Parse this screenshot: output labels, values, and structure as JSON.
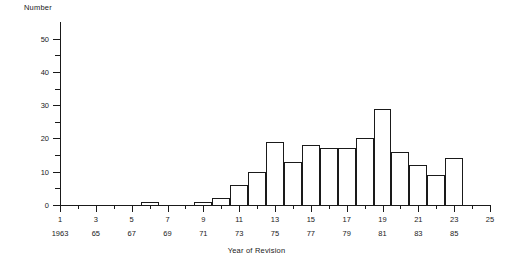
{
  "chart_data": {
    "type": "bar",
    "title": "",
    "xlabel": "Year of Revision",
    "ylabel": "Number",
    "ylim": [
      0,
      55
    ],
    "ytick_values": [
      0,
      10,
      20,
      30,
      40,
      50
    ],
    "ytick_labels": [
      "0",
      "10",
      "20",
      "30",
      "40",
      "50"
    ],
    "yminor_values": [
      5,
      15,
      25,
      35,
      45
    ],
    "grid": false,
    "legend": null,
    "xlim": [
      1,
      25
    ],
    "xtick_index_labels": [
      "1",
      "3",
      "5",
      "7",
      "9",
      "11",
      "13",
      "15",
      "17",
      "19",
      "21",
      "23",
      "25"
    ],
    "xtick_year_labels": [
      "1963",
      "65",
      "67",
      "69",
      "71",
      "73",
      "75",
      "77",
      "79",
      "81",
      "83",
      "85",
      ""
    ],
    "xtick_index_values": [
      1,
      3,
      5,
      7,
      9,
      11,
      13,
      15,
      17,
      19,
      21,
      23,
      25
    ],
    "xminor_values": [
      2,
      4,
      6,
      8,
      10,
      12,
      14,
      16,
      18,
      20,
      22,
      24
    ],
    "categories": [
      1,
      2,
      3,
      4,
      5,
      6,
      7,
      8,
      9,
      10,
      11,
      12,
      13,
      14,
      15,
      16,
      17,
      18,
      19,
      20,
      21,
      22,
      23,
      24,
      25
    ],
    "category_years": [
      1963,
      1964,
      1965,
      1966,
      1967,
      1968,
      1969,
      1970,
      1971,
      1972,
      1973,
      1974,
      1975,
      1976,
      1977,
      1978,
      1979,
      1980,
      1981,
      1982,
      1983,
      1984,
      1985,
      1986,
      1987
    ],
    "values": [
      0,
      0,
      0,
      0,
      0,
      1,
      0,
      0,
      1,
      2,
      6,
      10,
      19,
      13,
      18,
      17,
      17,
      20,
      29,
      16,
      12,
      9,
      14,
      0,
      0
    ]
  },
  "axes": {
    "y_axis_caption": "Number",
    "x_axis_caption": "Year of Revision"
  },
  "style": {
    "line_color": "#1a1a1a",
    "bar_fill": "#ffffff",
    "background": "#ffffff"
  }
}
